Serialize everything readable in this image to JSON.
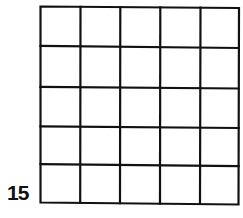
{
  "figure": {
    "label": "15",
    "grid": {
      "rows": 5,
      "columns": 5,
      "cells_filled": [],
      "line_color": "#111111",
      "background_color": "#ffffff"
    }
  }
}
